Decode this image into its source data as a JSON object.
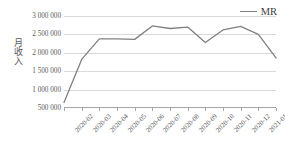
{
  "chart_data": {
    "type": "line",
    "title": "",
    "xlabel": "",
    "ylabel": "月收入",
    "categories": [
      "2020-02",
      "2020-03",
      "2020-04",
      "2020-05",
      "2020-06",
      "2020-07",
      "2020-08",
      "2020-09",
      "2020-10",
      "2020-11",
      "2020-12",
      "2021-01",
      "2021-02"
    ],
    "series": [
      {
        "name": "MR",
        "color": "#808080",
        "values": [
          650000,
          1820000,
          2380000,
          2380000,
          2365000,
          2730000,
          2660000,
          2700000,
          2280000,
          2620000,
          2720000,
          2500000,
          1860000
        ]
      }
    ],
    "ylim": [
      500000,
      3000000
    ],
    "ytick_values": [
      500000,
      1000000,
      1500000,
      2000000,
      2500000,
      3000000
    ],
    "ytick_labels": [
      "500 000",
      "1 000 000",
      "1 500 000",
      "2 000 000",
      "2 500 000",
      "3 000 000"
    ],
    "grid": true,
    "legend_position": "top-right"
  },
  "legend": {
    "entries": [
      {
        "label": "MR",
        "color": "#808080"
      }
    ]
  },
  "axes": {
    "y_title": "月收入",
    "axis_color": "#a6a6a6",
    "grid_color": "#d9d9d9"
  }
}
